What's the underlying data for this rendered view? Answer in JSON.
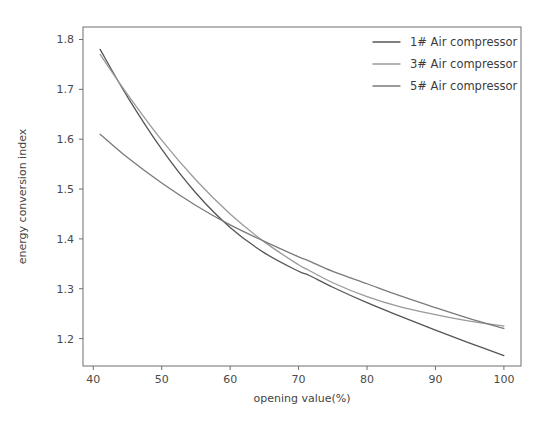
{
  "chart_data": {
    "type": "line",
    "title": "",
    "xlabel": "opening value(%)",
    "ylabel": "energy conversion index",
    "xlim": [
      38.5,
      102.5
    ],
    "ylim": [
      1.145,
      1.825
    ],
    "xticks": [
      40,
      50,
      60,
      70,
      80,
      90,
      100
    ],
    "xtick_labels": [
      "40",
      "50",
      "60",
      "70",
      "80",
      "90",
      "100"
    ],
    "yticks": [
      1.2,
      1.3,
      1.4,
      1.5,
      1.6,
      1.7,
      1.8
    ],
    "ytick_labels": [
      "1.2",
      "1.3",
      "1.4",
      "1.5",
      "1.6",
      "1.7",
      "1.8"
    ],
    "grid": false,
    "legend_position": "top-right",
    "x": [
      41,
      45,
      50,
      55,
      60,
      65,
      70,
      71.5,
      75,
      80,
      85,
      90,
      95,
      100
    ],
    "series": [
      {
        "name": "1# Air compressor",
        "color": "#555555",
        "values": [
          1.78,
          1.685,
          1.58,
          1.492,
          1.423,
          1.372,
          1.335,
          1.327,
          1.303,
          1.272,
          1.244,
          1.217,
          1.191,
          1.166
        ]
      },
      {
        "name": "3# Air compressor",
        "color": "#9a9a9a",
        "values": [
          1.77,
          1.69,
          1.598,
          1.518,
          1.45,
          1.394,
          1.348,
          1.337,
          1.312,
          1.284,
          1.263,
          1.248,
          1.235,
          1.225
        ]
      },
      {
        "name": "5# Air compressor",
        "color": "#7a7a7a",
        "values": [
          1.61,
          1.563,
          1.512,
          1.467,
          1.428,
          1.395,
          1.364,
          1.356,
          1.335,
          1.31,
          1.285,
          1.262,
          1.24,
          1.22
        ]
      }
    ]
  },
  "legend": {
    "items": [
      {
        "label": "1# Air compressor"
      },
      {
        "label": "3# Air compressor"
      },
      {
        "label": "5# Air compressor"
      }
    ]
  }
}
